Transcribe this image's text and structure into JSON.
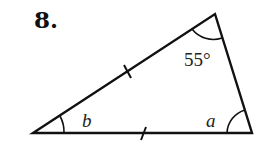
{
  "problem": {
    "number": "8.",
    "angle_top": "55°",
    "angle_left": "b",
    "angle_right": "a"
  },
  "triangle": {
    "vertices": {
      "left": [
        33,
        133
      ],
      "top": [
        215,
        14
      ],
      "right": [
        252,
        133
      ]
    },
    "congruent_sides": [
      "left-top",
      "left-right"
    ],
    "stroke_color": "#111111"
  }
}
